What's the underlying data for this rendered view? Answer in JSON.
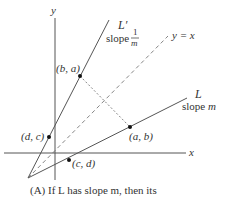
{
  "axes": {
    "x_label": "x",
    "y_label": "y"
  },
  "lines": {
    "L_prime": {
      "name": "L′",
      "slope_word": "slope",
      "slope_num": "1",
      "slope_den": "m"
    },
    "diagonal": {
      "label": "y = x"
    },
    "L": {
      "name": "L",
      "slope_text": "slope m"
    }
  },
  "points": {
    "ba": "(b, a)",
    "ab": "(a, b)",
    "dc": "(d, c)",
    "cd": "(c, d)"
  },
  "caption": {
    "prefix": "(A)",
    "text": "If L has slope m, then its"
  },
  "colors": {
    "line": "#555555",
    "text": "#333333"
  }
}
